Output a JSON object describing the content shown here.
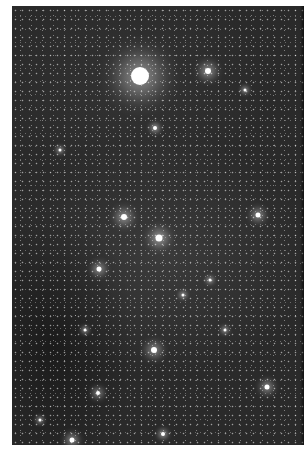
{
  "image": {
    "subject": "Star field (astronomical photograph)",
    "tone": "grayscale",
    "background_color": "#2a2a2a",
    "border_color": "#ffffff",
    "photo_box": {
      "left": 12,
      "top": 6,
      "width": 292,
      "height": 439
    }
  },
  "bright_stars": [
    {
      "x": 140,
      "y": 76,
      "r": 9,
      "glow": 22
    },
    {
      "x": 208,
      "y": 71,
      "r": 3,
      "glow": 9
    },
    {
      "x": 124,
      "y": 217,
      "r": 3,
      "glow": 9
    },
    {
      "x": 159,
      "y": 238,
      "r": 3.5,
      "glow": 10
    },
    {
      "x": 258,
      "y": 215,
      "r": 2.5,
      "glow": 7
    },
    {
      "x": 99,
      "y": 269,
      "r": 2.5,
      "glow": 7
    },
    {
      "x": 154,
      "y": 350,
      "r": 3,
      "glow": 8
    },
    {
      "x": 267,
      "y": 387,
      "r": 2.5,
      "glow": 7
    },
    {
      "x": 72,
      "y": 440,
      "r": 2.5,
      "glow": 7
    },
    {
      "x": 98,
      "y": 393,
      "r": 2,
      "glow": 6
    },
    {
      "x": 155,
      "y": 128,
      "r": 2,
      "glow": 5
    },
    {
      "x": 163,
      "y": 434,
      "r": 2,
      "glow": 5
    },
    {
      "x": 245,
      "y": 90,
      "r": 1.5,
      "glow": 4
    },
    {
      "x": 60,
      "y": 150,
      "r": 1.5,
      "glow": 4
    },
    {
      "x": 210,
      "y": 280,
      "r": 1.5,
      "glow": 4
    },
    {
      "x": 40,
      "y": 420,
      "r": 1.5,
      "glow": 4
    },
    {
      "x": 225,
      "y": 330,
      "r": 1.5,
      "glow": 4
    },
    {
      "x": 183,
      "y": 295,
      "r": 1.5,
      "glow": 4
    },
    {
      "x": 85,
      "y": 330,
      "r": 1.5,
      "glow": 4
    }
  ]
}
